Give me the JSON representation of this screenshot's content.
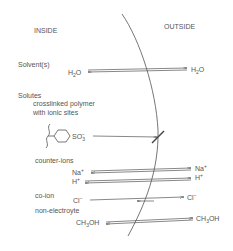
{
  "regions": {
    "inside": "INSIDE",
    "outside": "OUTSIDE"
  },
  "sections": {
    "solvents": "Solvent(s)",
    "solutes": "Solutes",
    "polymer_line1": "crosslinked polymer",
    "polymer_line2": "with ionic sites",
    "counter_ions": "counter-ions",
    "co_ion": "co-ion",
    "non_electrolyte": "non-electroyte"
  },
  "species": {
    "water": {
      "base": "H",
      "sub": "2",
      "tail": "O"
    },
    "sulfonate": {
      "base": "SO",
      "sub": "3",
      "sup": "−"
    },
    "sodium": {
      "base": "Na",
      "sup": "+"
    },
    "hydrogen": {
      "base": "H",
      "sup": "+"
    },
    "chloride": {
      "base": "Cl",
      "sup": "−"
    },
    "methanol": {
      "base": "CH",
      "sub": "3",
      "tail": "OH"
    }
  },
  "transport": [
    {
      "species": "H2O",
      "direction": "bidirectional",
      "permeable": true
    },
    {
      "species": "SO3-",
      "direction": "outward",
      "permeable": false
    },
    {
      "species": "Na+",
      "direction": "bidirectional",
      "permeable": true
    },
    {
      "species": "H+",
      "direction": "bidirectional",
      "permeable": true
    },
    {
      "species": "Cl-",
      "direction": "outward-dominant",
      "permeable": true
    },
    {
      "species": "CH3OH",
      "direction": "bidirectional",
      "permeable": true
    }
  ],
  "colors": {
    "ink": "#555555",
    "line": "#666666"
  }
}
